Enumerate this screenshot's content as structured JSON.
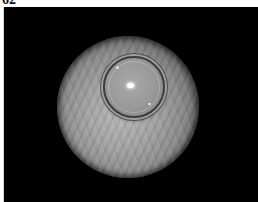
{
  "figure": {
    "label": "62",
    "colors": {
      "background": "#000000",
      "frame": "#ffffff",
      "tissue": "#a6a6a6",
      "highlight": "#ffffff"
    }
  }
}
